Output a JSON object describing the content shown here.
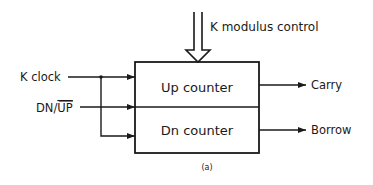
{
  "diagram": {
    "top_input": {
      "label": "K modulus control"
    },
    "inputs": [
      {
        "label": "K clock"
      },
      {
        "label_prefix": "DN/",
        "label_overline": "UP"
      }
    ],
    "blocks": [
      {
        "label": "Up counter"
      },
      {
        "label": "Dn counter"
      }
    ],
    "outputs": [
      {
        "label": "Carry"
      },
      {
        "label": "Borrow"
      }
    ],
    "caption": "(a)",
    "colors": {
      "line": "#1a1a1a",
      "background": "#ffffff"
    }
  }
}
